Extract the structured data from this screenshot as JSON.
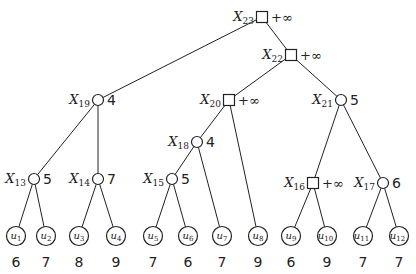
{
  "diagram": {
    "type": "game-tree",
    "internal_nodes": [
      {
        "id": "X23",
        "label": "X",
        "sub": "23",
        "shape": "square",
        "value": "+∞",
        "x": 262,
        "y": 17
      },
      {
        "id": "X22",
        "label": "X",
        "sub": "22",
        "shape": "square",
        "value": "+∞",
        "x": 291,
        "y": 55
      },
      {
        "id": "X19",
        "label": "X",
        "sub": "19",
        "shape": "circle",
        "value": "4",
        "x": 98,
        "y": 100
      },
      {
        "id": "X20",
        "label": "X",
        "sub": "20",
        "shape": "square",
        "value": "+∞",
        "x": 229,
        "y": 100
      },
      {
        "id": "X21",
        "label": "X",
        "sub": "21",
        "shape": "circle",
        "value": "5",
        "x": 341,
        "y": 100
      },
      {
        "id": "X18",
        "label": "X",
        "sub": "18",
        "shape": "circle",
        "value": "4",
        "x": 197,
        "y": 142
      },
      {
        "id": "X13",
        "label": "X",
        "sub": "13",
        "shape": "circle",
        "value": "5",
        "x": 34,
        "y": 179
      },
      {
        "id": "X14",
        "label": "X",
        "sub": "14",
        "shape": "circle",
        "value": "7",
        "x": 98,
        "y": 179
      },
      {
        "id": "X15",
        "label": "X",
        "sub": "15",
        "shape": "circle",
        "value": "5",
        "x": 172,
        "y": 179
      },
      {
        "id": "X16",
        "label": "X",
        "sub": "16",
        "shape": "square",
        "value": "+∞",
        "x": 313,
        "y": 183
      },
      {
        "id": "X17",
        "label": "X",
        "sub": "17",
        "shape": "circle",
        "value": "6",
        "x": 383,
        "y": 183
      }
    ],
    "leaves": [
      {
        "id": "u1",
        "label": "u",
        "sub": "1",
        "value": "6",
        "x": 16
      },
      {
        "id": "u2",
        "label": "u",
        "sub": "2",
        "value": "7",
        "x": 46
      },
      {
        "id": "u3",
        "label": "u",
        "sub": "3",
        "value": "8",
        "x": 79
      },
      {
        "id": "u4",
        "label": "u",
        "sub": "4",
        "value": "9",
        "x": 116
      },
      {
        "id": "u5",
        "label": "u",
        "sub": "5",
        "value": "7",
        "x": 153
      },
      {
        "id": "u6",
        "label": "u",
        "sub": "6",
        "value": "6",
        "x": 188
      },
      {
        "id": "u7",
        "label": "u",
        "sub": "7",
        "value": "7",
        "x": 222
      },
      {
        "id": "u8",
        "label": "u",
        "sub": "8",
        "value": "9",
        "x": 258
      },
      {
        "id": "u9",
        "label": "u",
        "sub": "9",
        "value": "6",
        "x": 291
      },
      {
        "id": "u10",
        "label": "u",
        "sub": "10",
        "value": "9",
        "x": 327
      },
      {
        "id": "u11",
        "label": "u",
        "sub": "11",
        "value": "7",
        "x": 363
      },
      {
        "id": "u12",
        "label": "u",
        "sub": "12",
        "value": "7",
        "x": 399
      }
    ],
    "leaf_y": 236,
    "leaf_value_y": 262,
    "edges": [
      [
        "X23",
        "X19"
      ],
      [
        "X23",
        "X22"
      ],
      [
        "X22",
        "X20"
      ],
      [
        "X22",
        "X21"
      ],
      [
        "X19",
        "X13"
      ],
      [
        "X19",
        "X14"
      ],
      [
        "X20",
        "X18"
      ],
      [
        "X20",
        "u8"
      ],
      [
        "X21",
        "X16"
      ],
      [
        "X21",
        "X17"
      ],
      [
        "X18",
        "X15"
      ],
      [
        "X18",
        "u7"
      ],
      [
        "X13",
        "u1"
      ],
      [
        "X13",
        "u2"
      ],
      [
        "X14",
        "u3"
      ],
      [
        "X14",
        "u4"
      ],
      [
        "X15",
        "u5"
      ],
      [
        "X15",
        "u6"
      ],
      [
        "X16",
        "u9"
      ],
      [
        "X16",
        "u10"
      ],
      [
        "X17",
        "u11"
      ],
      [
        "X17",
        "u12"
      ]
    ]
  }
}
